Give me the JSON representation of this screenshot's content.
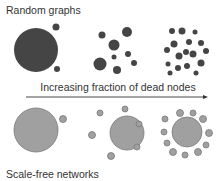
{
  "labels": {
    "top": "Random graphs",
    "arrow": "Increasing fraction of dead nodes",
    "bottom": "Scale-free networks"
  },
  "colors": {
    "random_node": "#454545",
    "scalefree_node": "#a0a0a0",
    "scalefree_stroke": "#7a7a7a",
    "arrow": "#333333"
  },
  "arrow": {
    "x1": 26,
    "x2": 208,
    "y": 97
  },
  "random_graphs": [
    {
      "stage": 1,
      "nodes": [
        [
          36,
          50,
          22
        ],
        [
          56,
          27,
          3.5
        ],
        [
          57,
          69,
          3
        ]
      ]
    },
    {
      "stage": 2,
      "nodes": [
        [
          127,
          32,
          5
        ],
        [
          102,
          35,
          3.5
        ],
        [
          114,
          45,
          5.5
        ],
        [
          114,
          57,
          2.5
        ],
        [
          128,
          54,
          3
        ],
        [
          100,
          64,
          6.5
        ],
        [
          134,
          63,
          3
        ],
        [
          117,
          70,
          4
        ]
      ]
    },
    {
      "stage": 3,
      "nodes": [
        [
          172,
          31,
          3
        ],
        [
          182,
          31,
          3.5
        ],
        [
          195,
          32,
          2.5
        ],
        [
          174,
          44,
          3.5
        ],
        [
          189,
          42,
          3
        ],
        [
          201,
          43,
          3
        ],
        [
          167,
          50,
          3
        ],
        [
          186,
          52,
          3
        ],
        [
          193,
          54,
          3.5
        ],
        [
          206,
          51,
          3
        ],
        [
          179,
          56,
          3.5
        ],
        [
          168,
          64,
          2.5
        ],
        [
          178,
          68,
          3
        ],
        [
          187,
          66,
          3
        ],
        [
          201,
          63,
          3.5
        ],
        [
          170,
          73,
          2.5
        ],
        [
          196,
          73,
          2.5
        ]
      ]
    }
  ],
  "scale_free_networks": [
    {
      "stage": 1,
      "nodes": [
        [
          36,
          130,
          22
        ],
        [
          63,
          119,
          3.5
        ]
      ]
    },
    {
      "stage": 2,
      "nodes": [
        [
          127,
          133,
          17
        ],
        [
          100,
          113,
          3
        ],
        [
          125,
          109,
          3
        ],
        [
          139,
          124,
          3
        ],
        [
          92,
          135,
          3.5
        ],
        [
          137,
          147,
          3
        ],
        [
          111,
          156,
          3.5
        ]
      ]
    },
    {
      "stage": 3,
      "nodes": [
        [
          187,
          132,
          15
        ],
        [
          180,
          113,
          3.5
        ],
        [
          193,
          113,
          3
        ],
        [
          203,
          119,
          3.5
        ],
        [
          165,
          119,
          3
        ],
        [
          209,
          133,
          3.5
        ],
        [
          164,
          132,
          3
        ],
        [
          167,
          143,
          3
        ],
        [
          206,
          145,
          3
        ],
        [
          173,
          152,
          3.5
        ],
        [
          198,
          152,
          3.5
        ],
        [
          185,
          155,
          3
        ]
      ]
    }
  ]
}
